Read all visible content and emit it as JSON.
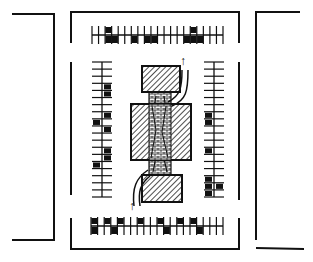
{
  "diagram": {
    "title": "Parking lot site plan sketch",
    "colors": {
      "ink": "#111111",
      "paper": "#ffffff",
      "hatch": "#222222",
      "brick_fill": "#f4f4f4"
    },
    "panels": [
      {
        "name": "left-lot-edge",
        "label": "Adjacent lot (left)"
      },
      {
        "name": "center-lot",
        "label": "Parking lot"
      },
      {
        "name": "right-lot-edge",
        "label": "Adjacent lot (right)"
      }
    ],
    "building": {
      "label": "Central building with paved walkway",
      "blocks": [
        {
          "name": "top-block",
          "x": 142,
          "y": 66,
          "w": 38,
          "h": 26
        },
        {
          "name": "middle-block",
          "x": 131,
          "y": 104,
          "w": 60,
          "h": 56
        },
        {
          "name": "bottom-block",
          "x": 142,
          "y": 175,
          "w": 40,
          "h": 27
        }
      ],
      "walkway": {
        "x": 149,
        "y": 92,
        "w": 22,
        "h": 84
      }
    },
    "arrows": [
      {
        "name": "exit-arrow-top",
        "label": "↑"
      },
      {
        "name": "entry-arrow-bottom",
        "label": "↑"
      }
    ],
    "stall_rows": {
      "top": {
        "count": 21,
        "cars_top": [
          3,
          16
        ],
        "cars_bottom": [
          3,
          4,
          7,
          9,
          10,
          15,
          16,
          17
        ]
      },
      "bottom": {
        "count": 21,
        "cars_top": [
          1,
          3,
          5,
          8,
          11,
          14,
          16
        ],
        "cars_bottom": [
          1,
          4,
          12,
          17
        ]
      },
      "left": {
        "count": 20,
        "cars_right": [
          4,
          5,
          8,
          10,
          13,
          14
        ],
        "cars_left": [
          9,
          15
        ]
      },
      "right": {
        "count": 20,
        "cars_left": [
          8,
          9,
          13,
          17,
          18,
          19
        ],
        "cars_right": [
          18
        ]
      }
    }
  }
}
